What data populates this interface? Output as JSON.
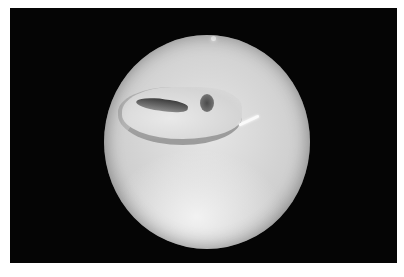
{
  "image": {
    "description": "Endoscopic circular view of a pale tissue surface with a dark elongated opening and a small round hole, framed by black background",
    "colors": {
      "page_background": "#ffffff",
      "frame_background": "#050505",
      "tissue_light": "#e6e6e6",
      "tissue_mid": "#cfcfcf",
      "cavity_dark": "#3c3c3c"
    }
  }
}
